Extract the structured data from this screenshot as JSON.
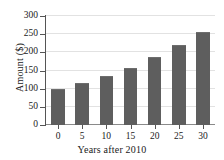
{
  "chart_data": {
    "type": "bar",
    "title": "",
    "xlabel": "Years after 2010",
    "ylabel": "Amount ($)",
    "categories": [
      "0",
      "5",
      "10",
      "15",
      "20",
      "25",
      "30"
    ],
    "values": [
      98,
      115,
      135,
      158,
      187,
      220,
      257
    ],
    "x": [
      0,
      5,
      10,
      15,
      20,
      25,
      30
    ],
    "xlim": [
      -2.5,
      32.5
    ],
    "ylim": [
      0,
      300
    ],
    "ytick_labels": [
      "0",
      "50",
      "100",
      "150",
      "200",
      "250",
      "300"
    ],
    "ytick_values": [
      0,
      50,
      100,
      150,
      200,
      250,
      300
    ],
    "xtick_labels": [
      "0",
      "5",
      "10",
      "15",
      "20",
      "25",
      "30"
    ],
    "grid": "horizontal",
    "legend": "none",
    "bar_color": "#5e5e5e",
    "grid_color": "#e2e2e2",
    "axis_color": "#555555"
  }
}
